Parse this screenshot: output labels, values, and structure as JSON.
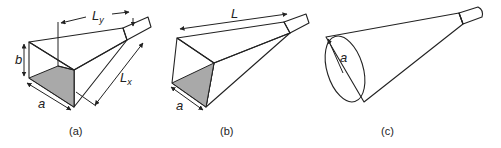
{
  "figure": {
    "panels": [
      {
        "id": "a",
        "caption": "(a)",
        "shape": "pyramidal horn",
        "labels": {
          "a": "a",
          "b": "b",
          "Ly": "L",
          "Ly_sub": "y",
          "Lx": "L",
          "Lx_sub": "x"
        }
      },
      {
        "id": "b",
        "caption": "(b)",
        "shape": "sectoral horn",
        "labels": {
          "L": "L",
          "a": "a"
        }
      },
      {
        "id": "c",
        "caption": "(c)",
        "shape": "conical horn",
        "labels": {
          "a": "a"
        }
      }
    ],
    "colors": {
      "face_light": "#ececec",
      "face_mid": "#e2e2e2",
      "aperture_dark": "#a9a9a9",
      "stroke": "#222222",
      "background": "#ffffff"
    }
  }
}
